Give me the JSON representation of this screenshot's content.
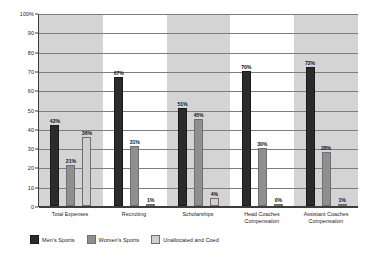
{
  "chart_data": {
    "type": "bar",
    "title": "",
    "xlabel": "",
    "ylabel": "",
    "ylim": [
      0,
      100
    ],
    "yticks": [
      0,
      10,
      20,
      30,
      40,
      50,
      60,
      70,
      80,
      90,
      100
    ],
    "ytick_labels": [
      "0",
      "10",
      "20",
      "30",
      "40",
      "50",
      "60",
      "70",
      "80",
      "90",
      "100%"
    ],
    "grid": true,
    "legend_position": "bottom-left",
    "categories": [
      "Total Expenses",
      "Recruiting",
      "Scholarships",
      "Head Coaches\nCompensation",
      "Assistant Coaches\nCompensation"
    ],
    "series": [
      {
        "name": "Men's Sports",
        "color": "#2b2b2b",
        "values": [
          42,
          67,
          51,
          70,
          72
        ],
        "labels": [
          "42%",
          "67%",
          "51%",
          "70%",
          "72%"
        ]
      },
      {
        "name": "Women's Sports",
        "color": "#8f8f8f",
        "values": [
          21,
          31,
          45,
          30,
          28
        ],
        "labels": [
          "21%",
          "31%",
          "45%",
          "30%",
          "28%"
        ]
      },
      {
        "name": "Unallocated and Coed",
        "color": "#cfcfcf",
        "values": [
          36,
          1,
          4,
          0,
          1
        ],
        "labels": [
          "36%",
          "1%",
          "4%",
          "0%",
          "1%"
        ]
      }
    ]
  },
  "colors": {
    "mens_sports": "#2b2b2b",
    "womens_sports": "#8f8f8f",
    "unallocated_coed": "#cfcfcf",
    "band_shaded": "#d4d4d4",
    "band_plain": "#ffffff",
    "gridline": "#7d7d7d",
    "axis": "#3c3c3c"
  }
}
